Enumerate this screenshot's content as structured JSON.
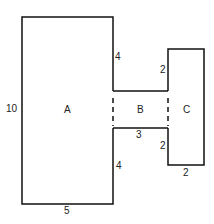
{
  "diagram": {
    "regions": [
      {
        "id": "A",
        "label": "A"
      },
      {
        "id": "B",
        "label": "B"
      },
      {
        "id": "C",
        "label": "C"
      }
    ],
    "dimensions": {
      "a_height": "10",
      "a_width": "5",
      "a_right_upper": "4",
      "a_right_lower": "4",
      "b_width": "3",
      "c_left_upper": "2",
      "c_left_lower": "2",
      "c_width": "2"
    }
  }
}
